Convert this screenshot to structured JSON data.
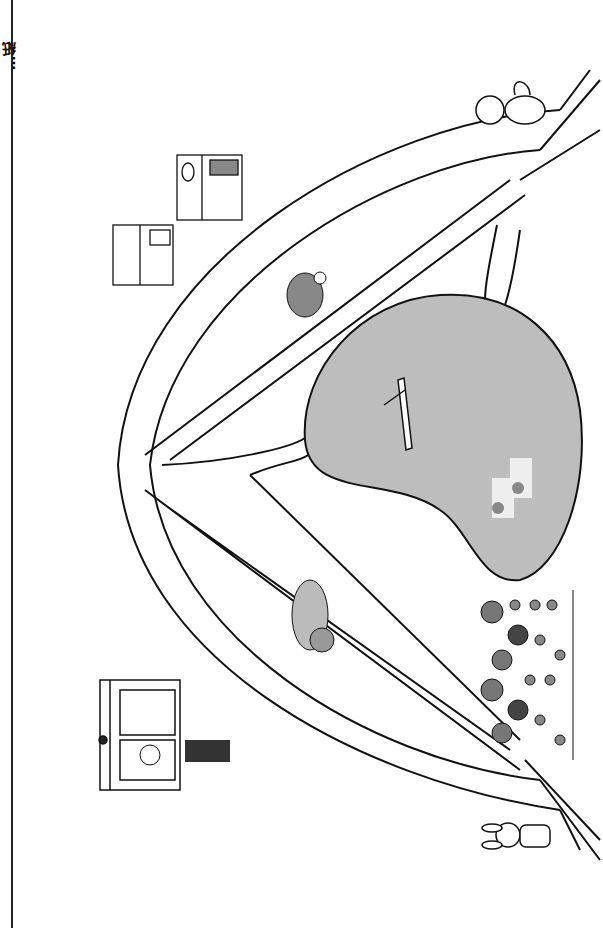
{
  "page": {
    "margin_text": "…紙"
  },
  "colors": {
    "ink": "#111111",
    "pond": "#bdbdbd",
    "paper": "#ffffff",
    "shade": "#9a9a9a"
  },
  "map": {
    "landmarks": [
      {
        "id": "bakery",
        "label": "bakery"
      },
      {
        "id": "cake-shop",
        "label": "cake shop"
      },
      {
        "id": "police-box",
        "label": "police box"
      },
      {
        "id": "pond",
        "label": "pond"
      },
      {
        "id": "sunflower-field",
        "label": "sunflower field"
      }
    ],
    "characters": [
      {
        "id": "fox",
        "label": "fox"
      },
      {
        "id": "rabbit",
        "label": "rabbit"
      },
      {
        "id": "turtle",
        "label": "turtle"
      },
      {
        "id": "dog",
        "label": "dog"
      },
      {
        "id": "police-officer",
        "label": "police officer"
      },
      {
        "id": "rower",
        "label": "rowboat"
      },
      {
        "id": "anglers",
        "label": "anglers"
      }
    ]
  }
}
